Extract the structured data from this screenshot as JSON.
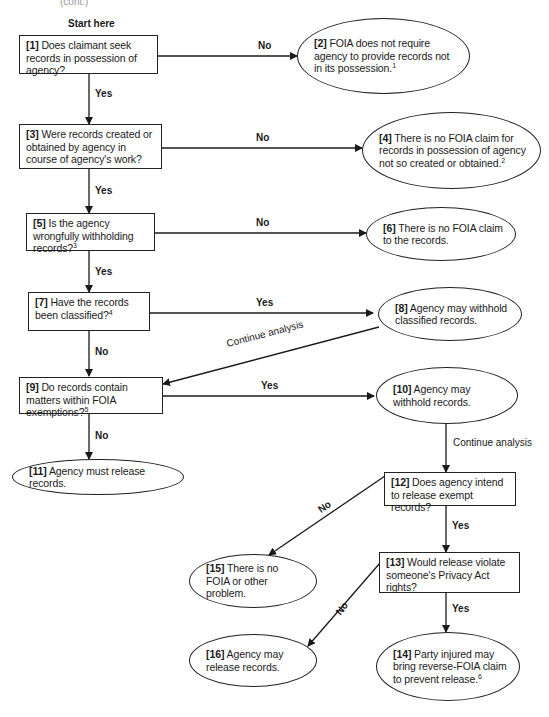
{
  "diagram": {
    "type": "flowchart",
    "top_fragment": "(cont.)",
    "start_label": "Start here",
    "nodes": [
      {
        "id": 1,
        "shape": "box",
        "num": "[1]",
        "text": "Does claimant seek records in possession of agency?",
        "sup": ""
      },
      {
        "id": 2,
        "shape": "oval",
        "num": "[2]",
        "text": "FOIA does not require agency to provide records not in its possession.",
        "sup": "1"
      },
      {
        "id": 3,
        "shape": "box",
        "num": "[3]",
        "text": "Were records created or obtained by agency in course of agency's work?",
        "sup": ""
      },
      {
        "id": 4,
        "shape": "oval",
        "num": "[4]",
        "text": "There is no FOIA claim for records in possession of agency not so created or obtained.",
        "sup": "2"
      },
      {
        "id": 5,
        "shape": "box",
        "num": "[5]",
        "text": "Is the agency wrongfully withholding records?",
        "sup": "3"
      },
      {
        "id": 6,
        "shape": "oval",
        "num": "[6]",
        "text": "There is no FOIA claim to the records.",
        "sup": ""
      },
      {
        "id": 7,
        "shape": "box",
        "num": "[7]",
        "text": "Have the records been classified?",
        "sup": "4"
      },
      {
        "id": 8,
        "shape": "oval",
        "num": "[8]",
        "text": "Agency may withhold classified records.",
        "sup": ""
      },
      {
        "id": 9,
        "shape": "box",
        "num": "[9]",
        "text": "Do records contain matters within FOIA exemptions?",
        "sup": "5"
      },
      {
        "id": 10,
        "shape": "oval",
        "num": "[10]",
        "text": "Agency may withhold records.",
        "sup": ""
      },
      {
        "id": 11,
        "shape": "oval",
        "num": "[11]",
        "text": "Agency must release records.",
        "sup": ""
      },
      {
        "id": 12,
        "shape": "box",
        "num": "[12]",
        "text": "Does agency intend to release exempt records?",
        "sup": ""
      },
      {
        "id": 13,
        "shape": "box",
        "num": "[13]",
        "text": "Would release violate someone's Privacy Act rights?",
        "sup": ""
      },
      {
        "id": 14,
        "shape": "oval",
        "num": "[14]",
        "text": "Party injured may bring reverse-FOIA claim to prevent release.",
        "sup": "6"
      },
      {
        "id": 15,
        "shape": "oval",
        "num": "[15]",
        "text": "There is no FOIA or other problem.",
        "sup": ""
      },
      {
        "id": 16,
        "shape": "oval",
        "num": "[16]",
        "text": "Agency may release records.",
        "sup": ""
      }
    ],
    "edges": [
      {
        "from": 1,
        "to": 2,
        "label": "No"
      },
      {
        "from": 1,
        "to": 3,
        "label": "Yes"
      },
      {
        "from": 3,
        "to": 4,
        "label": "No"
      },
      {
        "from": 3,
        "to": 5,
        "label": "Yes"
      },
      {
        "from": 5,
        "to": 6,
        "label": "No"
      },
      {
        "from": 5,
        "to": 7,
        "label": "Yes"
      },
      {
        "from": 7,
        "to": 8,
        "label": "Yes"
      },
      {
        "from": 7,
        "to": 9,
        "label": "No"
      },
      {
        "from": 8,
        "to": 9,
        "label": "Continue analysis"
      },
      {
        "from": 9,
        "to": 10,
        "label": "Yes"
      },
      {
        "from": 9,
        "to": 11,
        "label": "No"
      },
      {
        "from": 10,
        "to": 12,
        "label": "Continue analysis"
      },
      {
        "from": 12,
        "to": 15,
        "label": "No"
      },
      {
        "from": 12,
        "to": 13,
        "label": "Yes"
      },
      {
        "from": 13,
        "to": 16,
        "label": "No"
      },
      {
        "from": 13,
        "to": 14,
        "label": "Yes"
      }
    ]
  },
  "labels": {
    "no": "No",
    "yes": "Yes",
    "continue": "Continue analysis"
  },
  "colors": {
    "ink": "#1a1a1a",
    "background": "#ffffff"
  }
}
